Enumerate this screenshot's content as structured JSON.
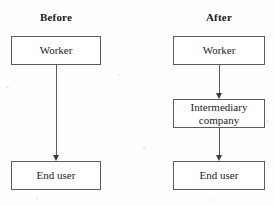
{
  "diagram": {
    "type": "flowchart",
    "orientation": "vertical",
    "columns": [
      {
        "id": "before",
        "title": "Before",
        "nodes": [
          {
            "id": "before-worker",
            "label": "Worker"
          },
          {
            "id": "before-enduser",
            "label": "End user"
          }
        ],
        "edges": [
          {
            "from": "before-worker",
            "to": "before-enduser",
            "arrow": "down"
          }
        ]
      },
      {
        "id": "after",
        "title": "After",
        "nodes": [
          {
            "id": "after-worker",
            "label": "Worker"
          },
          {
            "id": "after-intermediary",
            "label_line1": "Intermediary",
            "label_line2": "company"
          },
          {
            "id": "after-enduser",
            "label": "End user"
          }
        ],
        "edges": [
          {
            "from": "after-worker",
            "to": "after-intermediary",
            "arrow": "down"
          },
          {
            "from": "after-intermediary",
            "to": "after-enduser",
            "arrow": "down"
          }
        ]
      }
    ],
    "colors": {
      "background": "#fefefe",
      "box_border": "#5c5c5c",
      "box_fill": "#ffffff",
      "text": "#1c1c1c",
      "title_text": "#1a1a1a",
      "arrow": "#5c5c5c",
      "arrow_head": "#3a3a3a"
    }
  }
}
